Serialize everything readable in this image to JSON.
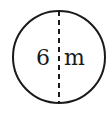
{
  "diagram": {
    "shape": "circle",
    "diameter_label": "6 m",
    "label_number": "6",
    "label_unit": "m",
    "line_style": "dashed",
    "stroke_color": "#1a1a1a",
    "background": "#ffffff"
  }
}
